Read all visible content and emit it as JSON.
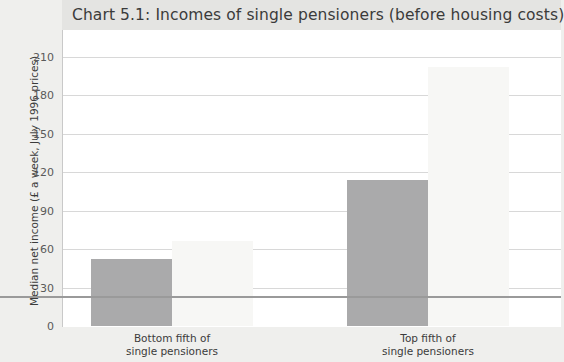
{
  "chart_data": {
    "type": "bar",
    "title": "Chart 5.1: Incomes of single pensioners (before housing costs)",
    "xlabel": "",
    "ylabel": "Median net income (£ a week, July 1996 prices)",
    "ylim": [
      0,
      210
    ],
    "yticks": [
      0,
      30,
      60,
      90,
      120,
      150,
      180,
      210
    ],
    "ytick_labels": [
      "0",
      "30",
      "60",
      "90",
      "120",
      "150",
      "180",
      "210"
    ],
    "grid": true,
    "legend": "none",
    "categories": [
      "Bottom fifth of single pensioners",
      "Top fifth of single pensioners"
    ],
    "category_lines": [
      [
        "Bottom fifth of",
        "single pensioners"
      ],
      [
        "Top fifth of",
        "single pensioners"
      ]
    ],
    "series": [
      {
        "name": "series-1",
        "color": "#aaaaab",
        "values": [
          52,
          114
        ]
      },
      {
        "name": "series-2",
        "color": "#f7f7f5",
        "values": [
          66,
          202
        ]
      }
    ]
  },
  "colors": {
    "page_background": "#efefed",
    "plot_background": "#ffffff",
    "title_band": "#e4e4e2",
    "gridline": "#d8d8d8",
    "axis": "#9a9a9a",
    "bar_dark": "#aaaaab",
    "bar_light": "#f7f7f5",
    "text": "#3b3b3b"
  }
}
